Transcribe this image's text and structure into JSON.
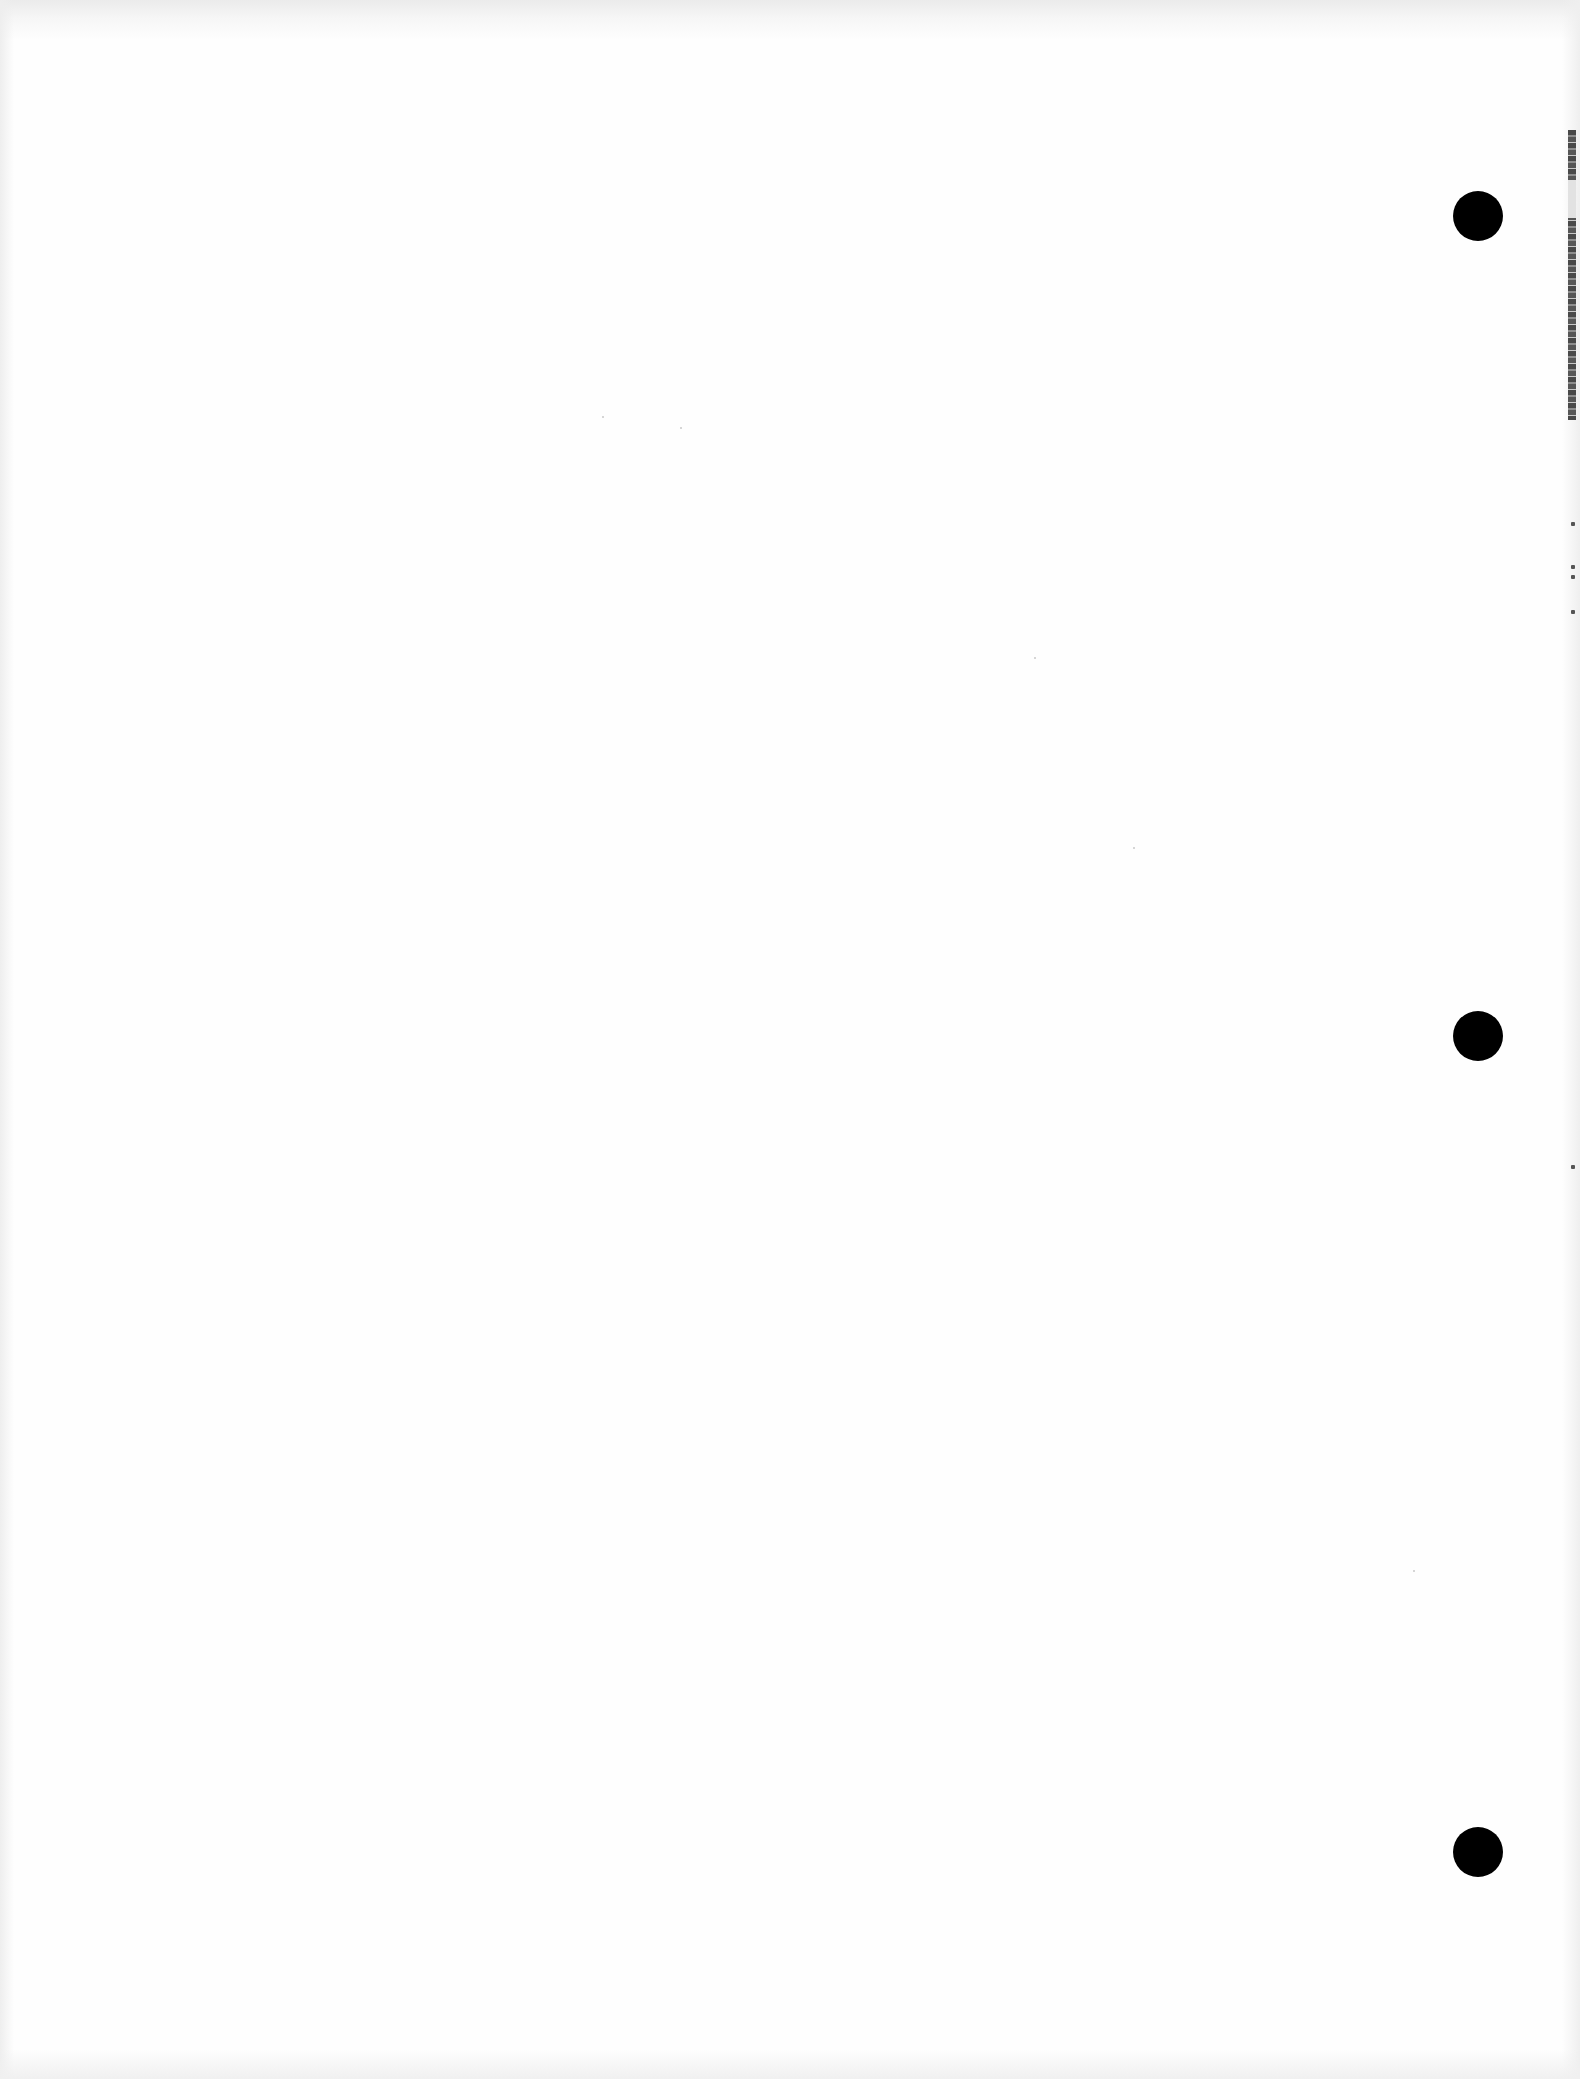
{
  "document": {
    "type": "blank scanned page",
    "text_content": "",
    "punch_holes": [
      {
        "name": "top",
        "cx": 1478,
        "cy": 216,
        "diameter": 50
      },
      {
        "name": "middle",
        "cx": 1478,
        "cy": 1036,
        "diameter": 50
      },
      {
        "name": "bottom",
        "cx": 1478,
        "cy": 1852,
        "diameter": 50
      }
    ],
    "colors": {
      "paper": "#fefefe",
      "hole": "#000000",
      "scan_shadow": "#ebebeb"
    }
  }
}
